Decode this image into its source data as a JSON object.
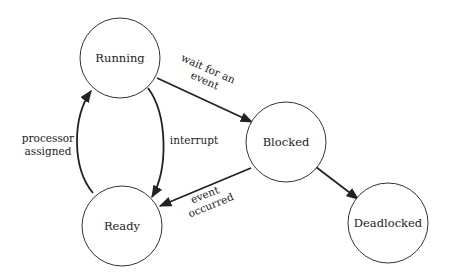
{
  "diagram": {
    "type": "state-transition",
    "nodes": [
      {
        "id": "running",
        "label": "Running"
      },
      {
        "id": "blocked",
        "label": "Blocked"
      },
      {
        "id": "ready",
        "label": "Ready"
      },
      {
        "id": "deadlocked",
        "label": "Deadlocked"
      }
    ],
    "edges": [
      {
        "from": "running",
        "to": "blocked",
        "label_lines": [
          "wait for an",
          "event"
        ]
      },
      {
        "from": "running",
        "to": "ready",
        "label_lines": [
          "interrupt"
        ]
      },
      {
        "from": "ready",
        "to": "running",
        "label_lines": [
          "processor",
          "assigned"
        ]
      },
      {
        "from": "blocked",
        "to": "ready",
        "label_lines": [
          "event",
          "occurred"
        ]
      },
      {
        "from": "blocked",
        "to": "deadlocked",
        "label_lines": []
      }
    ]
  }
}
